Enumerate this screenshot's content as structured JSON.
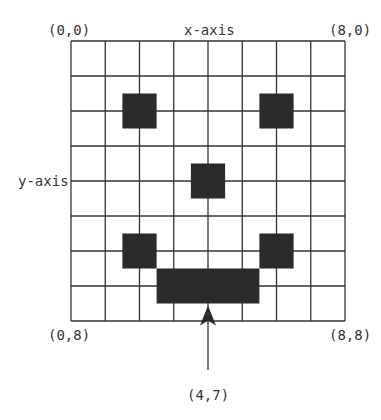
{
  "labels": {
    "top_left": "(0,0)",
    "top_right": "(8,0)",
    "bottom_left": "(0,8)",
    "bottom_right": "(8,8)",
    "x_axis": "x-axis",
    "y_axis": "y-axis",
    "pointer": "(4,7)"
  },
  "grid": {
    "cols": 8,
    "rows": 8,
    "left": 71,
    "top": 41,
    "right": 345,
    "bottom": 321,
    "line_color": "#333333",
    "fill_color": "#2b2b2b"
  },
  "filled_rects": [
    {
      "name": "left-eye",
      "x0": 1.5,
      "y0": 1.5,
      "x1": 2.5,
      "y1": 2.5
    },
    {
      "name": "right-eye",
      "x0": 5.5,
      "y0": 1.5,
      "x1": 6.5,
      "y1": 2.5
    },
    {
      "name": "nose",
      "x0": 3.5,
      "y0": 3.5,
      "x1": 4.5,
      "y1": 4.5
    },
    {
      "name": "left-mouth-corner",
      "x0": 1.5,
      "y0": 5.5,
      "x1": 2.5,
      "y1": 6.5
    },
    {
      "name": "right-mouth-corner",
      "x0": 5.5,
      "y0": 5.5,
      "x1": 6.5,
      "y1": 6.5
    },
    {
      "name": "mouth-bar",
      "x0": 2.5,
      "y0": 6.5,
      "x1": 5.5,
      "y1": 7.5
    }
  ],
  "arrow": {
    "x": 4,
    "y_tip": 7.5,
    "y_tail": 370
  }
}
